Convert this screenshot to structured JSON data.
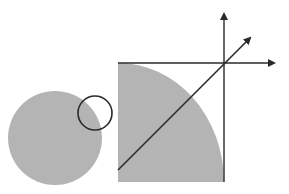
{
  "diagram": {
    "colors": {
      "fill": "#b4b4b4",
      "stroke": "#2a2a2a",
      "background": "#ffffff"
    },
    "shapes": {
      "disk": {
        "cx": 55,
        "cy": 138,
        "r": 47
      },
      "small_circle": {
        "cx": 95,
        "cy": 113,
        "r": 17
      },
      "square": {
        "x": 118,
        "y": 63,
        "w": 106,
        "h": 119
      },
      "quarter_disk": {
        "cx": 118,
        "cy": 182,
        "rx": 106,
        "ry": 119
      },
      "axes_origin": {
        "x": 224,
        "y": 63
      },
      "axis_up_end": {
        "x": 224,
        "y": 10
      },
      "axis_right_end": {
        "x": 276,
        "y": 63
      },
      "diagonal": {
        "x1": 118,
        "y1": 170,
        "x2": 252,
        "y2": 36
      }
    },
    "labels": []
  }
}
